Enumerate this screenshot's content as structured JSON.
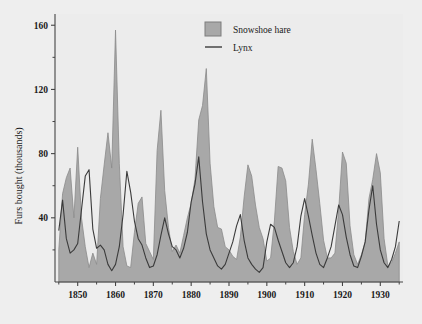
{
  "chart_data": {
    "type": "area",
    "title": "",
    "subtitle": "",
    "xlabel": "",
    "ylabel": "Furs bought (thousands)",
    "xlim": [
      1844,
      1936
    ],
    "ylim": [
      0,
      167
    ],
    "grid": false,
    "legend_position": "top-right",
    "xticks": [
      1850,
      1860,
      1870,
      1880,
      1890,
      1900,
      1910,
      1920,
      1930
    ],
    "xtick_labels": [
      "1850",
      "1860",
      "1870",
      "1880",
      "1890",
      "1900",
      "1910",
      "1920",
      "1930"
    ],
    "yticks": [
      40,
      80,
      120,
      160
    ],
    "ytick_labels": [
      "40",
      "80",
      "120",
      "160"
    ],
    "yticks_minor": [
      20,
      60,
      100,
      140
    ],
    "x": [
      1845,
      1846,
      1847,
      1848,
      1849,
      1850,
      1851,
      1852,
      1853,
      1854,
      1855,
      1856,
      1857,
      1858,
      1859,
      1860,
      1861,
      1862,
      1863,
      1864,
      1865,
      1866,
      1867,
      1868,
      1869,
      1870,
      1871,
      1872,
      1873,
      1874,
      1875,
      1876,
      1877,
      1878,
      1879,
      1880,
      1881,
      1882,
      1883,
      1884,
      1885,
      1886,
      1887,
      1888,
      1889,
      1890,
      1891,
      1892,
      1893,
      1894,
      1895,
      1896,
      1897,
      1898,
      1899,
      1900,
      1901,
      1902,
      1903,
      1904,
      1905,
      1906,
      1907,
      1908,
      1909,
      1910,
      1911,
      1912,
      1913,
      1914,
      1915,
      1916,
      1917,
      1918,
      1919,
      1920,
      1921,
      1922,
      1923,
      1924,
      1925,
      1926,
      1927,
      1928,
      1929,
      1930,
      1931,
      1932,
      1933,
      1934,
      1935
    ],
    "series": [
      {
        "name": "Snowshoe hare",
        "kind": "filled-area",
        "color": "#a8a8a8",
        "edge_color": "#8a8a8a",
        "values": [
          20,
          55,
          65,
          71,
          40,
          84,
          40,
          22,
          9,
          18,
          11,
          52,
          73,
          93,
          71,
          157,
          74,
          22,
          10,
          9,
          31,
          49,
          53,
          24,
          19,
          14,
          82,
          107,
          57,
          34,
          19,
          23,
          18,
          29,
          40,
          49,
          64,
          101,
          110,
          133,
          74,
          47,
          34,
          33,
          22,
          20,
          16,
          14,
          28,
          53,
          73,
          66,
          48,
          34,
          27,
          13,
          15,
          38,
          72,
          71,
          63,
          34,
          19,
          11,
          15,
          42,
          61,
          89,
          70,
          49,
          26,
          15,
          15,
          18,
          45,
          81,
          74,
          35,
          17,
          11,
          17,
          25,
          52,
          64,
          80,
          68,
          27,
          10,
          12,
          18,
          25
        ]
      },
      {
        "name": "Lynx",
        "kind": "line",
        "color": "#3b3b3b",
        "values": [
          32,
          51,
          27,
          18,
          20,
          24,
          45,
          66,
          70,
          33,
          21,
          23,
          20,
          11,
          7,
          11,
          22,
          42,
          69,
          56,
          38,
          27,
          23,
          15,
          9,
          10,
          17,
          29,
          40,
          30,
          22,
          20,
          15,
          21,
          31,
          50,
          61,
          78,
          50,
          30,
          20,
          15,
          10,
          8,
          11,
          18,
          25,
          35,
          42,
          26,
          15,
          11,
          8,
          6,
          9,
          25,
          36,
          34,
          26,
          19,
          12,
          9,
          12,
          22,
          41,
          52,
          41,
          29,
          18,
          11,
          9,
          15,
          22,
          35,
          48,
          42,
          28,
          17,
          10,
          9,
          16,
          25,
          45,
          60,
          36,
          20,
          12,
          9,
          14,
          22,
          38
        ]
      }
    ],
    "legend": [
      {
        "label": "Snowshoe hare",
        "marker": "filled-square",
        "color": "#a8a8a8"
      },
      {
        "label": "Lynx",
        "marker": "line",
        "color": "#3b3b3b"
      }
    ]
  },
  "colors": {
    "figure_background": "#eeeeee",
    "plot_background": "#ececec",
    "hare_fill": "#a8a8a8",
    "lynx_line": "#3b3b3b",
    "axis": "#444444",
    "text": "#1a1a1a"
  }
}
